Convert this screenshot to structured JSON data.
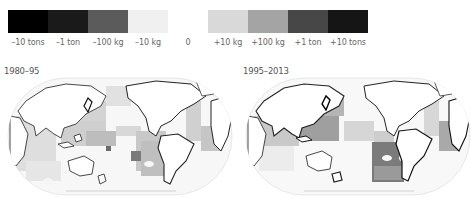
{
  "legend": {
    "items": [
      {
        "label": "–10 tons",
        "color": "#000000",
        "x": 8
      },
      {
        "label": "–1 ton",
        "color": "#1a1a1a",
        "x": 48
      },
      {
        "label": "–100 kg",
        "color": "#5b5b5b",
        "x": 88
      },
      {
        "label": "–10 kg",
        "color": "#f0f0f0",
        "x": 128
      },
      {
        "label": "+10 kg",
        "color": "#d9d9d9",
        "x": 208
      },
      {
        "label": "+100 kg",
        "color": "#a4a4a4",
        "x": 248
      },
      {
        "label": "+1 ton",
        "color": "#474747",
        "x": 288
      },
      {
        "label": "+10 tons",
        "color": "#151515",
        "x": 328
      }
    ],
    "zero_label": "0"
  },
  "maps": [
    {
      "title": "1980–95"
    },
    {
      "title": "1995–2013"
    }
  ],
  "colors": {
    "land": "#ffffff",
    "coast": "#222222",
    "ocean_base": "#f6f6f6",
    "outline": "#dddddd"
  }
}
